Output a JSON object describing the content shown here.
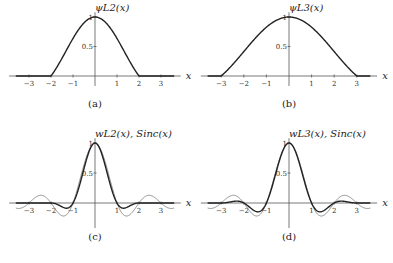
{
  "chart_data": [
    {
      "id": "a",
      "type": "line",
      "title": "ψ_L2(x)",
      "caption": "(a)",
      "xlabel": "x",
      "xticks": [
        -3,
        -2,
        -1,
        1,
        2,
        3
      ],
      "yticks": [
        0.5,
        1
      ],
      "xlim": [
        -3.5,
        3.5
      ],
      "ylim": [
        0,
        1
      ],
      "series": [
        {
          "name": "ψ_L2(x)",
          "support": [
            -2,
            2
          ],
          "peak": 1.0,
          "x": [
            -3,
            -2,
            -1,
            0,
            1,
            2,
            3
          ],
          "y": [
            0,
            0,
            0.5,
            1,
            0.5,
            0,
            0
          ]
        }
      ]
    },
    {
      "id": "b",
      "type": "line",
      "title": "ψ_L3(x)",
      "caption": "(b)",
      "xlabel": "x",
      "xticks": [
        -3,
        -2,
        -1,
        1,
        2,
        3
      ],
      "yticks": [
        0.5,
        1
      ],
      "xlim": [
        -3.5,
        3.5
      ],
      "ylim": [
        0,
        1
      ],
      "series": [
        {
          "name": "ψ_L3(x)",
          "support": [
            -3,
            3
          ],
          "peak": 1.0,
          "x": [
            -3,
            -2,
            -1,
            0,
            1,
            2,
            3
          ],
          "y": [
            0,
            0.2,
            0.7,
            1,
            0.7,
            0.2,
            0
          ]
        }
      ]
    },
    {
      "id": "c",
      "type": "line",
      "title": "w_L2(x), Sinc(x)",
      "caption": "(c)",
      "xlabel": "x",
      "xticks": [
        -3,
        -2,
        -1,
        1,
        2,
        3
      ],
      "yticks": [
        0.5,
        1
      ],
      "xlim": [
        -3.5,
        3.5
      ],
      "ylim": [
        -0.3,
        1
      ],
      "series": [
        {
          "name": "w_L2(x)",
          "window": "Lanczos a=2"
        },
        {
          "name": "Sinc(x)"
        }
      ]
    },
    {
      "id": "d",
      "type": "line",
      "title": "w_L3(x), Sinc(x)",
      "caption": "(d)",
      "xlabel": "x",
      "xticks": [
        -3,
        -2,
        -1,
        1,
        2,
        3
      ],
      "yticks": [
        0.5,
        1
      ],
      "xlim": [
        -3.5,
        3.5
      ],
      "ylim": [
        -0.3,
        1
      ],
      "series": [
        {
          "name": "w_L3(x)",
          "window": "Lanczos a=3"
        },
        {
          "name": "Sinc(x)"
        }
      ]
    }
  ],
  "labels": {
    "a": {
      "title": "ψL2(x)",
      "caption": "(a)"
    },
    "b": {
      "title": "ψL3(x)",
      "caption": "(b)"
    },
    "c": {
      "title": "wL2(x), Sinc(x)",
      "caption": "(c)"
    },
    "d": {
      "title": "wL3(x), Sinc(x)",
      "caption": "(d)"
    },
    "xlabel": "x",
    "ytick_half": "0.5",
    "ytick_one": "1"
  }
}
